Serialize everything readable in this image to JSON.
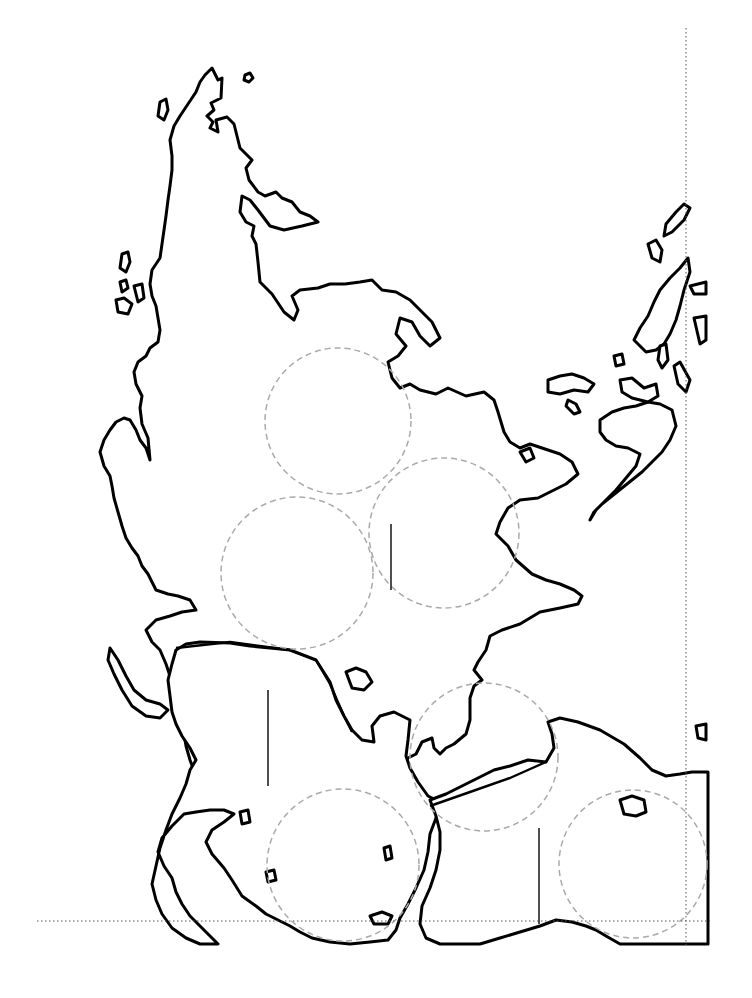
{
  "map": {
    "background": "#ffffff",
    "coastline_color": "#000000",
    "circle_color": "#aaaaaa",
    "frame_color": "#555555",
    "circles": [
      {
        "id": "c1",
        "cx": 338,
        "cy": 421,
        "r": 73
      },
      {
        "id": "c2",
        "cx": 444,
        "cy": 533,
        "r": 75
      },
      {
        "id": "c3",
        "cx": 297,
        "cy": 573,
        "r": 76
      },
      {
        "id": "c4",
        "cx": 484,
        "cy": 757,
        "r": 74
      },
      {
        "id": "c5",
        "cx": 343,
        "cy": 865,
        "r": 76
      },
      {
        "id": "c6",
        "cx": 633,
        "cy": 864,
        "r": 74
      }
    ],
    "ticks": [
      {
        "id": "t1",
        "x": 391,
        "y1": 524,
        "y2": 590
      },
      {
        "id": "t2",
        "x": 268,
        "y1": 690,
        "y2": 786
      },
      {
        "id": "t3",
        "x": 539,
        "y1": 828,
        "y2": 924
      }
    ],
    "frame": {
      "vertical": {
        "x": 686,
        "y1": 28,
        "y2": 945
      },
      "horizontal": {
        "y": 921,
        "x1": 37,
        "x2": 710
      }
    }
  }
}
